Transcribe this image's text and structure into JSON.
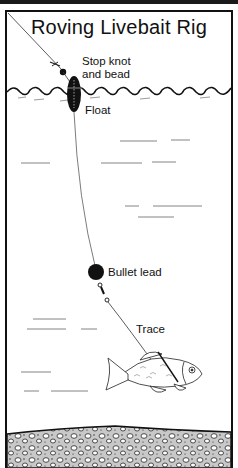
{
  "title": "Roving Livebait Rig",
  "labels": {
    "stop_knot": "Stop knot",
    "and_bead": "and bead",
    "float": "Float",
    "bullet_lead": "Bullet lead",
    "trace": "Trace"
  },
  "colors": {
    "ink": "#111111",
    "background": "#ffffff",
    "gravel": "#bdbdbd"
  }
}
